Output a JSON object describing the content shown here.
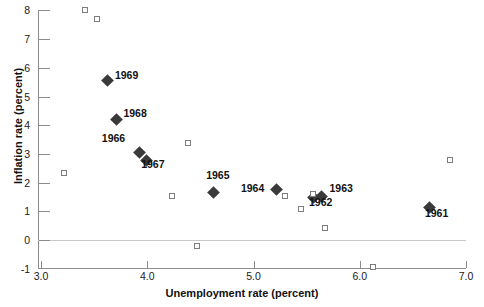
{
  "chart_data": {
    "type": "scatter",
    "title": "",
    "xlabel": "Unemployment rate (percent)",
    "ylabel": "Inflation rate (percent)",
    "xlim": [
      3.0,
      7.0
    ],
    "ylim": [
      -1,
      8
    ],
    "xticks": [
      "3.0",
      "4.0",
      "5.0",
      "6.0",
      "7.0"
    ],
    "xtick_values": [
      3.0,
      4.0,
      5.0,
      6.0,
      7.0
    ],
    "yticks": [
      "8",
      "7",
      "6",
      "5",
      "4",
      "3",
      "2",
      "1",
      "0",
      "-1"
    ],
    "ytick_values": [
      8,
      7,
      6,
      5,
      4,
      3,
      2,
      1,
      0,
      -1
    ],
    "grid": false,
    "legend": "none",
    "series": [
      {
        "name": "labeled-years",
        "marker": "filled-diamond",
        "color": "#3a3a3a",
        "points": [
          {
            "label": "1969",
            "x": 3.63,
            "y": 5.55,
            "label_dx": 7,
            "label_dy": -6
          },
          {
            "label": "1968",
            "x": 3.71,
            "y": 4.2,
            "label_dx": 7,
            "label_dy": -6
          },
          {
            "label": "1966",
            "x": 3.93,
            "y": 3.05,
            "label_dx": -38,
            "label_dy": -14
          },
          {
            "label": "1967",
            "x": 3.99,
            "y": 2.78,
            "label_dx": -5,
            "label_dy": 4
          },
          {
            "label": "1965",
            "x": 4.62,
            "y": 1.65,
            "label_dx": -7,
            "label_dy": -18
          },
          {
            "label": "1964",
            "x": 5.22,
            "y": 1.75,
            "label_dx": -36,
            "label_dy": -2
          },
          {
            "label": "1963",
            "x": 5.64,
            "y": 1.5,
            "label_dx": 8,
            "label_dy": -9
          },
          {
            "label": "1962",
            "x": 5.56,
            "y": 1.47,
            "label_dx": -4,
            "label_dy": 4
          },
          {
            "label": "1961",
            "x": 6.66,
            "y": 1.13,
            "label_dx": -5,
            "label_dy": 5
          }
        ]
      },
      {
        "name": "unlabeled-observations",
        "marker": "open-square",
        "color": "#7d7d7d",
        "points": [
          {
            "x": 3.41,
            "y": 8.0
          },
          {
            "x": 3.53,
            "y": 7.7
          },
          {
            "x": 3.22,
            "y": 2.32
          },
          {
            "x": 4.38,
            "y": 3.38
          },
          {
            "x": 4.23,
            "y": 1.52
          },
          {
            "x": 4.47,
            "y": -0.2
          },
          {
            "x": 5.3,
            "y": 1.54
          },
          {
            "x": 5.45,
            "y": 1.08
          },
          {
            "x": 5.56,
            "y": 1.62
          },
          {
            "x": 5.67,
            "y": 0.42
          },
          {
            "x": 6.12,
            "y": -0.95
          },
          {
            "x": 6.85,
            "y": 2.8
          }
        ]
      }
    ]
  }
}
